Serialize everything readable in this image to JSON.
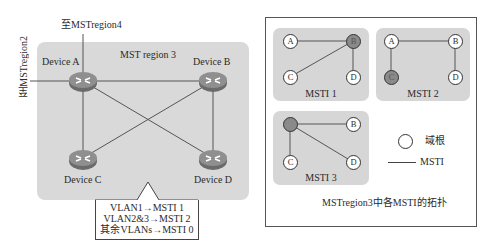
{
  "left_diagram": {
    "region_title": "MST region 3",
    "external_links": {
      "top": "至MSTregion4",
      "left": "至MSTregion2"
    },
    "devices": [
      {
        "id": "A",
        "label": "Device A"
      },
      {
        "id": "B",
        "label": "Device B"
      },
      {
        "id": "C",
        "label": "Device C"
      },
      {
        "id": "D",
        "label": "Device D"
      }
    ],
    "links": [
      [
        "A",
        "B"
      ],
      [
        "A",
        "C"
      ],
      [
        "B",
        "D"
      ],
      [
        "A",
        "D"
      ],
      [
        "B",
        "C"
      ]
    ],
    "mapping": {
      "lines": [
        "VLAN1→MSTI 1",
        "VLAN2&3→MSTI 2",
        "其余VLANs→MSTI 0"
      ]
    }
  },
  "right_panel": {
    "caption": "MSTregion3中各MSTI的拓扑",
    "instances": [
      {
        "name": "MSTI 1",
        "root": "B",
        "nodes": [
          "A",
          "B",
          "C",
          "D"
        ],
        "links": [
          [
            "A",
            "B"
          ],
          [
            "B",
            "C"
          ],
          [
            "B",
            "D"
          ]
        ]
      },
      {
        "name": "MSTI 2",
        "root": "C",
        "nodes": [
          "A",
          "B",
          "C",
          "D"
        ],
        "links": [
          [
            "A",
            "B"
          ],
          [
            "A",
            "C"
          ],
          [
            "B",
            "D"
          ]
        ]
      },
      {
        "name": "MSTI 3",
        "root": "A",
        "nodes": [
          "A",
          "B",
          "C",
          "D"
        ],
        "links": [
          [
            "A",
            "B"
          ],
          [
            "A",
            "C"
          ],
          [
            "A",
            "D"
          ]
        ]
      }
    ],
    "legend": {
      "root_label": "域根",
      "line_label": "MSTI"
    }
  },
  "colors": {
    "region_bg": "#d9d9d9",
    "root_fill": "#8a8a8a",
    "line": "#555555"
  }
}
